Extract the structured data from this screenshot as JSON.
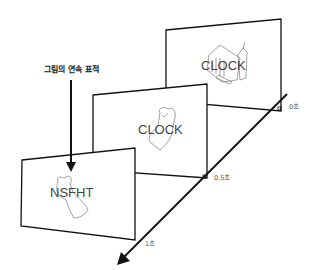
{
  "diagram": {
    "title_label": "그림의 연속 표적",
    "frames": [
      {
        "word": "CLOCK",
        "time_label": "0초",
        "position": "back"
      },
      {
        "word": "CLOCK",
        "time_label": "0.5초",
        "position": "middle"
      },
      {
        "word": "NSFHT",
        "time_label": "1초",
        "position": "front"
      }
    ],
    "colors": {
      "line": "#111111",
      "text": "#444444",
      "sketch": "#888888",
      "background": "#ffffff"
    }
  }
}
